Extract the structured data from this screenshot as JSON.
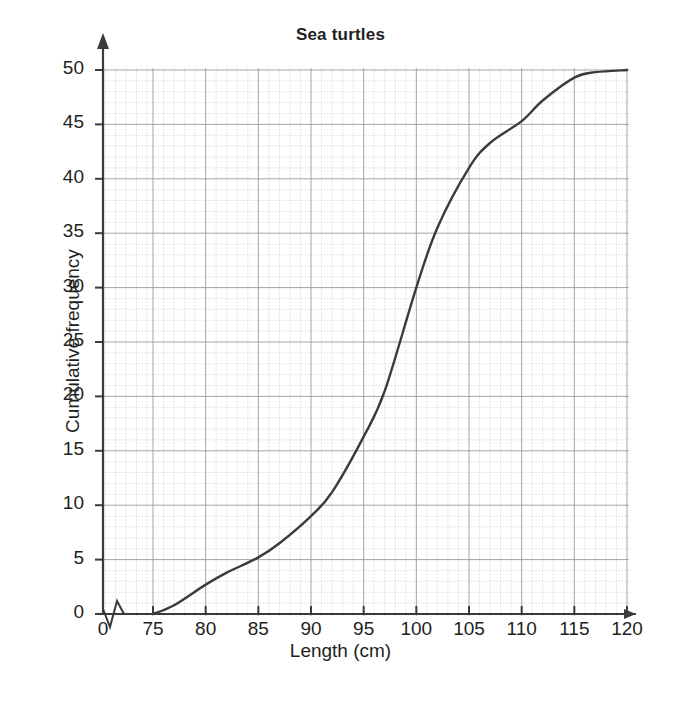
{
  "chart_data": {
    "type": "line",
    "title": "Sea turtles",
    "xlabel": "Length (cm)",
    "ylabel": "Cumulative frequency",
    "xlim": [
      75,
      120
    ],
    "ylim": [
      0,
      50
    ],
    "x_break": true,
    "x_break_note": "axis broken between 0 and 75",
    "grid": "major and minor dashed grid; minor every 1 unit, major every 5 units",
    "legend": "none",
    "x_tick_labels": [
      "0",
      "75",
      "80",
      "85",
      "90",
      "95",
      "100",
      "105",
      "110",
      "115",
      "120"
    ],
    "y_tick_labels": [
      "0",
      "5",
      "10",
      "15",
      "20",
      "25",
      "30",
      "35",
      "40",
      "45",
      "50"
    ],
    "x": [
      75,
      80,
      85,
      90,
      95,
      100,
      105,
      110,
      115,
      120
    ],
    "values": [
      0,
      2.7,
      5.2,
      9.0,
      16.3,
      30.0,
      41.0,
      45.3,
      49.3,
      50.0
    ],
    "series": [
      {
        "name": "Cumulative frequency",
        "color": "#3b3b3b",
        "points": [
          {
            "x": 75,
            "y": 0
          },
          {
            "x": 77,
            "y": 0.8
          },
          {
            "x": 80,
            "y": 2.7
          },
          {
            "x": 82,
            "y": 3.8
          },
          {
            "x": 85,
            "y": 5.2
          },
          {
            "x": 87,
            "y": 6.5
          },
          {
            "x": 90,
            "y": 9.0
          },
          {
            "x": 92,
            "y": 11.2
          },
          {
            "x": 95,
            "y": 16.3
          },
          {
            "x": 97,
            "y": 20.5
          },
          {
            "x": 100,
            "y": 30.0
          },
          {
            "x": 102,
            "y": 35.5
          },
          {
            "x": 105,
            "y": 41.0
          },
          {
            "x": 107,
            "y": 43.3
          },
          {
            "x": 110,
            "y": 45.3
          },
          {
            "x": 112,
            "y": 47.2
          },
          {
            "x": 115,
            "y": 49.3
          },
          {
            "x": 117,
            "y": 49.8
          },
          {
            "x": 120,
            "y": 50.0
          }
        ]
      }
    ]
  },
  "colors": {
    "curve": "#3b3b3b",
    "axis": "#3b3b3b",
    "grid_major": "#9a9a9a",
    "grid_minor": "#c9c9c9",
    "text": "#231f20",
    "background": "#ffffff"
  }
}
